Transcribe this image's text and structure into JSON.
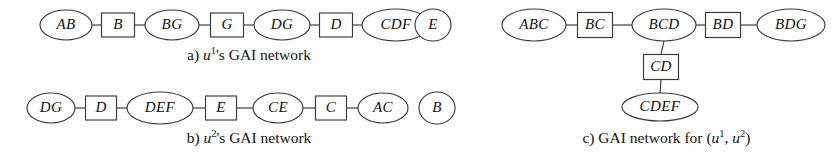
{
  "figure": {
    "background_color": "#fdfdfd",
    "stroke_color": "#3a3a3a",
    "fill_color": "#ffffff",
    "text_color": "#111111"
  },
  "panels": [
    {
      "id": "panel-a",
      "caption_prefix": "a)",
      "caption_var": "u",
      "caption_sup": "1",
      "caption_suffix": "'s GAI network",
      "nodes": [
        {
          "id": "a-AB",
          "label": "AB",
          "shape": "ellipse",
          "cx": 66,
          "cy": 25,
          "rx": 26,
          "ry": 15
        },
        {
          "id": "a-B",
          "label": "B",
          "shape": "rect",
          "cx": 118,
          "cy": 25,
          "w": 33,
          "h": 24
        },
        {
          "id": "a-BG",
          "label": "BG",
          "shape": "ellipse",
          "cx": 172,
          "cy": 25,
          "rx": 27,
          "ry": 15
        },
        {
          "id": "a-G",
          "label": "G",
          "shape": "rect",
          "cx": 227,
          "cy": 25,
          "w": 33,
          "h": 24
        },
        {
          "id": "a-DG",
          "label": "DG",
          "shape": "ellipse",
          "cx": 282,
          "cy": 25,
          "rx": 28,
          "ry": 15
        },
        {
          "id": "a-D",
          "label": "D",
          "shape": "rect",
          "cx": 336,
          "cy": 25,
          "w": 33,
          "h": 24
        },
        {
          "id": "a-CDF",
          "label": "CDF",
          "shape": "ellipse",
          "cx": 396,
          "cy": 25,
          "rx": 34,
          "ry": 16
        },
        {
          "id": "a-E",
          "label": "E",
          "shape": "ellipse",
          "cx": 433,
          "cy": 25,
          "rx": 18,
          "ry": 16
        }
      ],
      "edges": [
        {
          "from": "a-AB",
          "to": "a-B"
        },
        {
          "from": "a-B",
          "to": "a-BG"
        },
        {
          "from": "a-BG",
          "to": "a-G"
        },
        {
          "from": "a-G",
          "to": "a-DG"
        },
        {
          "from": "a-DG",
          "to": "a-D"
        },
        {
          "from": "a-D",
          "to": "a-CDF"
        }
      ]
    },
    {
      "id": "panel-b",
      "caption_prefix": "b)",
      "caption_var": "u",
      "caption_sup": "2",
      "caption_suffix": "'s GAI network",
      "nodes": [
        {
          "id": "b-DG",
          "label": "DG",
          "shape": "ellipse",
          "cx": 51,
          "cy": 108,
          "rx": 24,
          "ry": 15
        },
        {
          "id": "b-D",
          "label": "D",
          "shape": "rect",
          "cx": 101,
          "cy": 108,
          "w": 31,
          "h": 24
        },
        {
          "id": "b-DEF",
          "label": "DEF",
          "shape": "ellipse",
          "cx": 160,
          "cy": 108,
          "rx": 33,
          "ry": 16
        },
        {
          "id": "b-E",
          "label": "E",
          "shape": "rect",
          "cx": 221,
          "cy": 108,
          "w": 31,
          "h": 24
        },
        {
          "id": "b-CE",
          "label": "CE",
          "shape": "ellipse",
          "cx": 278,
          "cy": 108,
          "rx": 25,
          "ry": 15
        },
        {
          "id": "b-C",
          "label": "C",
          "shape": "rect",
          "cx": 331,
          "cy": 108,
          "w": 31,
          "h": 24
        },
        {
          "id": "b-AC",
          "label": "AC",
          "shape": "ellipse",
          "cx": 383,
          "cy": 108,
          "rx": 25,
          "ry": 15
        },
        {
          "id": "b-B",
          "label": "B",
          "shape": "ellipse",
          "cx": 437,
          "cy": 108,
          "rx": 18,
          "ry": 16
        }
      ],
      "edges": [
        {
          "from": "b-DG",
          "to": "b-D"
        },
        {
          "from": "b-D",
          "to": "b-DEF"
        },
        {
          "from": "b-DEF",
          "to": "b-E"
        },
        {
          "from": "b-E",
          "to": "b-CE"
        },
        {
          "from": "b-CE",
          "to": "b-C"
        },
        {
          "from": "b-C",
          "to": "b-AC"
        }
      ]
    },
    {
      "id": "panel-c",
      "caption_prefix": "c) GAI network for (",
      "caption_var": "u",
      "caption_sup": "1",
      "caption_mid": ", ",
      "caption_var2": "u",
      "caption_sup2": "2",
      "caption_suffix": ")",
      "nodes": [
        {
          "id": "c-ABC",
          "label": "ABC",
          "shape": "ellipse",
          "cx": 534,
          "cy": 25,
          "rx": 32,
          "ry": 16
        },
        {
          "id": "c-BC",
          "label": "BC",
          "shape": "rect",
          "cx": 595,
          "cy": 25,
          "w": 35,
          "h": 25
        },
        {
          "id": "c-BCD",
          "label": "BCD",
          "shape": "ellipse",
          "cx": 664,
          "cy": 25,
          "rx": 32,
          "ry": 16
        },
        {
          "id": "c-BD",
          "label": "BD",
          "shape": "rect",
          "cx": 723,
          "cy": 25,
          "w": 35,
          "h": 25
        },
        {
          "id": "c-BDG",
          "label": "BDG",
          "shape": "ellipse",
          "cx": 791,
          "cy": 25,
          "rx": 34,
          "ry": 16
        },
        {
          "id": "c-CD",
          "label": "CD",
          "shape": "rect",
          "cx": 661,
          "cy": 67,
          "w": 35,
          "h": 25
        },
        {
          "id": "c-CDEF",
          "label": "CDEF",
          "shape": "ellipse",
          "cx": 660,
          "cy": 107,
          "rx": 38,
          "ry": 14
        }
      ],
      "edges": [
        {
          "from": "c-ABC",
          "to": "c-BC"
        },
        {
          "from": "c-BC",
          "to": "c-BCD"
        },
        {
          "from": "c-BCD",
          "to": "c-BD"
        },
        {
          "from": "c-BD",
          "to": "c-BDG"
        },
        {
          "from": "c-BCD",
          "to": "c-CD"
        },
        {
          "from": "c-CD",
          "to": "c-CDEF"
        }
      ]
    }
  ]
}
